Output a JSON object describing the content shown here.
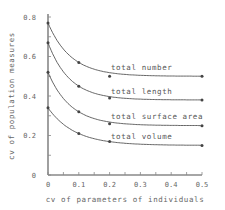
{
  "chart_data": {
    "type": "line",
    "title": "",
    "xlabel": "cv of parameters of individuals",
    "ylabel": "cv of population measures",
    "xlim": [
      0,
      0.5
    ],
    "ylim": [
      0,
      0.8
    ],
    "xticks": [
      "0",
      "0.1",
      "0.2",
      "0.3",
      "0.4",
      "0.5"
    ],
    "yticks": [
      "0",
      "0.2",
      "0.4",
      "0.6",
      "0.8"
    ],
    "grid": false,
    "legend": "inline labels above curves",
    "x": [
      0,
      0.1,
      0.2,
      0.5
    ],
    "series": [
      {
        "name": "total number",
        "values": [
          0.77,
          0.57,
          0.5,
          0.5
        ]
      },
      {
        "name": "total length",
        "values": [
          0.67,
          0.45,
          0.39,
          0.38
        ]
      },
      {
        "name": "total surface area",
        "values": [
          0.52,
          0.32,
          0.26,
          0.25
        ]
      },
      {
        "name": "total volume",
        "values": [
          0.34,
          0.21,
          0.17,
          0.15
        ]
      }
    ]
  },
  "colors": {
    "axis": "#888888",
    "curve": "#555555",
    "text": "#666666"
  }
}
